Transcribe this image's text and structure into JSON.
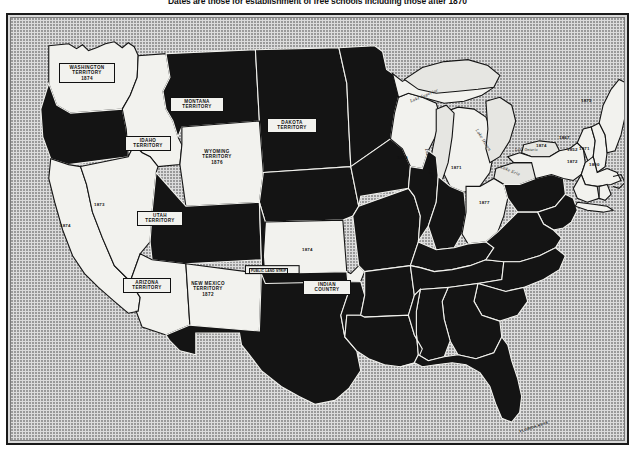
{
  "figure": {
    "title": "Dates are those for establishment of free schools including those after 1870",
    "map_name": "united-states-free-schools-map",
    "colors": {
      "land_filled": "#141414",
      "land_open": "#f2f2ee",
      "background": "#dcdcdc",
      "border": "#1a1a1a",
      "label_text": "#111111"
    },
    "legend_note": "Filled (black) areas indicate states; open (white) areas are territories and states with dated entries."
  },
  "territories": [
    {
      "name": "WASHINGTON\nTERRITORY",
      "line1": "WASHINGTON",
      "line2": "TERRITORY",
      "date": "1874"
    },
    {
      "name": "MONTANA\nTERRITORY",
      "line1": "MONTANA",
      "line2": "TERRITORY",
      "date": ""
    },
    {
      "name": "DAKOTA\nTERRITORY",
      "line1": "DAKOTA",
      "line2": "TERRITORY",
      "date": ""
    },
    {
      "name": "IDAHO\nTERRITORY",
      "line1": "IDAHO",
      "line2": "TERRITORY",
      "date": ""
    },
    {
      "name": "WYOMING\nTERRITORY",
      "line1": "WYOMING",
      "line2": "TERRITORY",
      "date": "1876"
    },
    {
      "name": "UTAH\nTERRITORY",
      "line1": "UTAH",
      "line2": "TERRITORY",
      "date": ""
    },
    {
      "name": "ARIZONA\nTERRITORY",
      "line1": "ARIZONA",
      "line2": "TERRITORY",
      "date": ""
    },
    {
      "name": "NEW MEXICO\nTERRITORY",
      "line1": "NEW MEXICO",
      "line2": "TERRITORY",
      "date": "1872"
    },
    {
      "name": "INDIAN\nCOUNTRY",
      "line1": "INDIAN",
      "line2": "COUNTRY",
      "date": ""
    }
  ],
  "labels": {
    "washington_l1": "WASHINGTON",
    "washington_l2": "TERRITORY",
    "washington_date": "1874",
    "montana_l1": "MONTANA",
    "montana_l2": "TERRITORY",
    "dakota_l1": "DAKOTA",
    "dakota_l2": "TERRITORY",
    "idaho_l1": "IDAHO",
    "idaho_l2": "TERRITORY",
    "wyoming_l1": "WYOMING",
    "wyoming_l2": "TERRITORY",
    "wyoming_date": "1876",
    "utah_l1": "UTAH",
    "utah_l2": "TERRITORY",
    "arizona_l1": "ARIZONA",
    "arizona_l2": "TERRITORY",
    "newmexico_l1": "NEW MEXICO",
    "newmexico_l2": "TERRITORY",
    "newmexico_date": "1872",
    "indian_l1": "INDIAN",
    "indian_l2": "COUNTRY",
    "public_land_strip": "PUBLIC LAND STRIP",
    "florida_keys": "FLORIDA KEYS"
  },
  "state_dates": [
    {
      "state": "California",
      "date": "1874"
    },
    {
      "state": "Nevada",
      "date": "1873"
    },
    {
      "state": "Kansas",
      "date": "1874"
    },
    {
      "state": "Wisconsin",
      "date": "1879"
    },
    {
      "state": "Michigan",
      "date": "1871"
    },
    {
      "state": "Ohio",
      "date": "1877"
    },
    {
      "state": "Maine",
      "date": "1875"
    },
    {
      "state": "Vermont",
      "date": "1867"
    },
    {
      "state": "New Hampshire",
      "date": "1871"
    },
    {
      "state": "New York",
      "date": "1874"
    },
    {
      "state": "Massachusetts",
      "date": "1852"
    },
    {
      "state": "Connecticut",
      "date": "1872"
    },
    {
      "state": "Rhode Island",
      "date": "1800"
    }
  ],
  "dates": {
    "california": "1874",
    "nevada": "1873",
    "kansas": "1874",
    "wisconsin": "1879",
    "michigan": "1871",
    "ohio": "1877",
    "maine": "1875",
    "vermont": "1867",
    "new_hampshire": "1871",
    "new_york": "1874",
    "massachusetts": "1852",
    "connecticut": "1872",
    "rhode_island": "1800"
  },
  "lakes": {
    "superior": "Lake Superior",
    "michigan": "Lake Michigan",
    "huron": "Lake Huron",
    "erie": "Lake Erie",
    "ontario": "Lake Ontario"
  }
}
